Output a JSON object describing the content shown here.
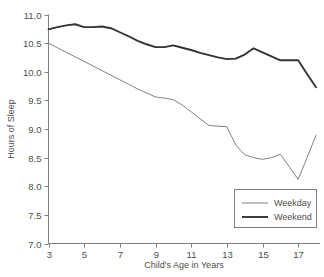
{
  "chart_data": {
    "type": "line",
    "title": "",
    "xlabel": "Child's Age in Years",
    "ylabel": "Hours of Sleep",
    "xlim": [
      3,
      18
    ],
    "ylim": [
      7.0,
      11.0
    ],
    "grid": false,
    "legend_position": "bottom-right",
    "xticks": [
      3,
      5,
      7,
      9,
      11,
      13,
      15,
      17
    ],
    "xtick_labels": [
      "3",
      "5",
      "7",
      "9",
      "11",
      "13",
      "15",
      "17"
    ],
    "yticks": [
      7.0,
      7.5,
      8.0,
      8.5,
      9.0,
      9.5,
      10.0,
      10.5,
      11.0
    ],
    "ytick_labels": [
      "7.0",
      "7.5",
      "8.0",
      "8.5",
      "9.0",
      "9.5",
      "10.0",
      "10.5",
      "11.0"
    ],
    "x": [
      3,
      3.5,
      4,
      4.5,
      5,
      5.5,
      6,
      6.5,
      7,
      7.5,
      8,
      8.5,
      9,
      9.5,
      10,
      10.5,
      11,
      11.5,
      12,
      12.5,
      13,
      13.5,
      14,
      14.5,
      15,
      15.5,
      16,
      16.5,
      17,
      17.5,
      18
    ],
    "series": [
      {
        "name": "Weekday",
        "color": "#808080",
        "line_width": 1,
        "values": [
          10.5,
          10.42,
          10.34,
          10.26,
          10.18,
          10.1,
          10.02,
          9.94,
          9.86,
          9.78,
          9.7,
          9.63,
          9.56,
          9.54,
          9.51,
          9.42,
          9.3,
          9.18,
          9.06,
          9.05,
          9.04,
          8.72,
          8.55,
          8.5,
          8.47,
          8.5,
          8.56,
          8.34,
          8.12,
          8.5,
          8.89
        ]
      },
      {
        "name": "Weekend",
        "color": "#333333",
        "line_width": 1.9,
        "values": [
          10.74,
          10.78,
          10.81,
          10.83,
          10.78,
          10.78,
          10.79,
          10.76,
          10.69,
          10.62,
          10.54,
          10.48,
          10.43,
          10.43,
          10.46,
          10.42,
          10.38,
          10.33,
          10.29,
          10.25,
          10.22,
          10.23,
          10.3,
          10.41,
          10.34,
          10.27,
          10.2,
          10.2,
          10.2,
          9.96,
          9.73
        ]
      }
    ]
  },
  "legend": {
    "entries": [
      {
        "label": "Weekday"
      },
      {
        "label": "Weekend"
      }
    ]
  },
  "axes": {
    "y_title": "Hours of Sleep",
    "x_title": "Child's Age in Years"
  }
}
